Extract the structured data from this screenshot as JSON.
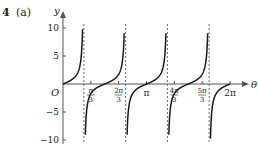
{
  "question": {
    "number": "4",
    "part": "(a)"
  },
  "chart_data": {
    "type": "line",
    "title": "",
    "function": "y = tan(2θ)",
    "xlabel": "θ",
    "ylabel": "y",
    "origin_label": "O",
    "xlim": [
      0,
      6.2832
    ],
    "ylim": [
      -10,
      10
    ],
    "x_ticks": [
      {
        "value": 1.0472,
        "label_num": "π",
        "label_den": "3"
      },
      {
        "value": 2.0944,
        "label_num": "2π",
        "label_den": "3"
      },
      {
        "value": 3.1416,
        "label": "π"
      },
      {
        "value": 4.1888,
        "label_num": "4π",
        "label_den": "3"
      },
      {
        "value": 5.236,
        "label_num": "5π",
        "label_den": "3"
      },
      {
        "value": 6.2832,
        "label": "2π"
      }
    ],
    "y_ticks": [
      {
        "value": 10,
        "label": "10"
      },
      {
        "value": 5,
        "label": "5"
      },
      {
        "value": -5,
        "label": "−5"
      },
      {
        "value": -10,
        "label": "−10"
      }
    ],
    "asymptotes": [
      0.7854,
      2.3562,
      3.927,
      5.4978
    ],
    "zeros": [
      0,
      1.5708,
      3.1416,
      4.7124,
      6.2832
    ],
    "grid": false,
    "legend": "none",
    "colors": {
      "curve": "#1a1a1a",
      "axis": "#555555",
      "asymptote": "#444444"
    }
  }
}
